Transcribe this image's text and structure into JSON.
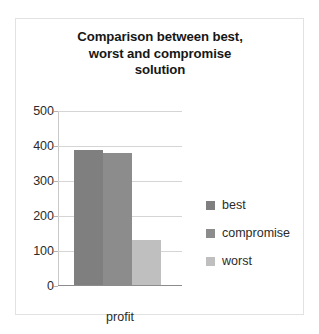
{
  "chart_data": {
    "type": "bar",
    "title": "Comparison between best, worst and compromise solution",
    "title_lines": [
      "Comparison between best,",
      "worst and compromise",
      "solution"
    ],
    "categories": [
      "profit"
    ],
    "series": [
      {
        "name": "best",
        "values": [
          385
        ],
        "color": "#7f7f7f"
      },
      {
        "name": "compromise",
        "values": [
          378
        ],
        "color": "#8c8c8c"
      },
      {
        "name": "worst",
        "values": [
          130
        ],
        "color": "#bfbfbf"
      }
    ],
    "xlabel": "",
    "ylabel": "",
    "ylim": [
      0,
      500
    ],
    "yticks": [
      0,
      100,
      200,
      300,
      400,
      500
    ],
    "ytick_labels": [
      "0",
      "100",
      "200",
      "300",
      "400",
      "500"
    ],
    "grid": true,
    "legend_position": "right",
    "plot_background": "#ffffff",
    "gridline_color": "#d5d5d5",
    "border_color": "#e2e2e2"
  }
}
